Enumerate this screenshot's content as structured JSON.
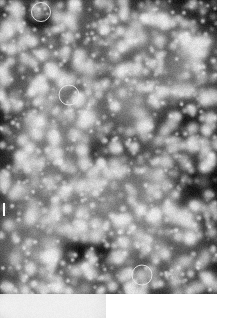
{
  "figure": {
    "width": 225,
    "height": 318,
    "background_color": "#ffffff"
  },
  "main_field": {
    "name": "Dense stellar field (greyscale astronomical exposure)",
    "x": 0,
    "y": 0,
    "width": 217,
    "height": 294,
    "background_color": "#050505",
    "sky_level": "#151515",
    "star_color": "#ffffff",
    "seed": 20240512,
    "star_count": 1180,
    "bright_star_count": 120,
    "psf_sigma_min": 1.1,
    "psf_sigma_max": 4.6,
    "bright_blobs": [
      {
        "cx": 190,
        "cy": 44,
        "r": 11,
        "peak": 1.0
      },
      {
        "cx": 88,
        "cy": 118,
        "r": 9,
        "peak": 1.0
      },
      {
        "cx": 84,
        "cy": 162,
        "r": 8,
        "peak": 0.97
      },
      {
        "cx": 12,
        "cy": 48,
        "r": 7,
        "peak": 0.95
      },
      {
        "cx": 196,
        "cy": 52,
        "r": 8,
        "peak": 0.93
      },
      {
        "cx": 160,
        "cy": 92,
        "r": 7,
        "peak": 0.9
      },
      {
        "cx": 55,
        "cy": 214,
        "r": 8,
        "peak": 0.95
      },
      {
        "cx": 122,
        "cy": 242,
        "r": 7,
        "peak": 0.92
      },
      {
        "cx": 170,
        "cy": 210,
        "r": 8,
        "peak": 0.94
      },
      {
        "cx": 30,
        "cy": 268,
        "r": 7,
        "peak": 0.9
      },
      {
        "cx": 205,
        "cy": 150,
        "r": 7,
        "peak": 0.9
      },
      {
        "cx": 68,
        "cy": 36,
        "r": 6,
        "peak": 0.88
      },
      {
        "cx": 145,
        "cy": 18,
        "r": 6,
        "peak": 0.88
      },
      {
        "cx": 22,
        "cy": 140,
        "r": 6,
        "peak": 0.86
      },
      {
        "cx": 112,
        "cy": 286,
        "r": 6,
        "peak": 0.88
      }
    ],
    "dark_lanes": [
      {
        "cx": 112,
        "cy": 148,
        "rx": 46,
        "ry": 22,
        "rot": -18
      },
      {
        "cx": 30,
        "cy": 18,
        "rx": 30,
        "ry": 14,
        "rot": 10
      },
      {
        "cx": 180,
        "cy": 126,
        "rx": 26,
        "ry": 38,
        "rot": 24
      },
      {
        "cx": 90,
        "cy": 250,
        "rx": 34,
        "ry": 16,
        "rot": -8
      }
    ]
  },
  "annotations": {
    "marker_type": "circle",
    "stroke_color": "#e8e8e8",
    "stroke_width": 1,
    "fill": "none",
    "circles": [
      {
        "id": "target-1",
        "cx": 41,
        "cy": 12,
        "r": 9.5
      },
      {
        "id": "target-2",
        "cx": 69,
        "cy": 95,
        "r": 10
      },
      {
        "id": "target-3",
        "cx": 142,
        "cy": 275,
        "r": 10
      }
    ]
  },
  "edge_marker": {
    "name": "left-edge-tick",
    "x": 3,
    "y": 203,
    "width": 2,
    "height": 13,
    "color": "#fbfbfb"
  },
  "inset_field": {
    "name": "Sparse comparison field (lower panel)",
    "x": 0,
    "y": 294,
    "width": 106,
    "height": 24,
    "background_color": "#040404",
    "seed": 8821,
    "star_count": 14,
    "glow": {
      "cx": 6,
      "cy": 11,
      "r": 12,
      "peak": 1.0
    },
    "faint_points": [
      {
        "cx": 36,
        "cy": 16,
        "r": 1.0,
        "peak": 0.55
      },
      {
        "cx": 58,
        "cy": 8,
        "r": 0.9,
        "peak": 0.5
      },
      {
        "cx": 82,
        "cy": 18,
        "r": 0.8,
        "peak": 0.45
      },
      {
        "cx": 96,
        "cy": 6,
        "r": 0.8,
        "peak": 0.4
      },
      {
        "cx": 24,
        "cy": 20,
        "r": 0.7,
        "peak": 0.35
      },
      {
        "cx": 68,
        "cy": 21,
        "r": 0.7,
        "peak": 0.33
      }
    ]
  }
}
